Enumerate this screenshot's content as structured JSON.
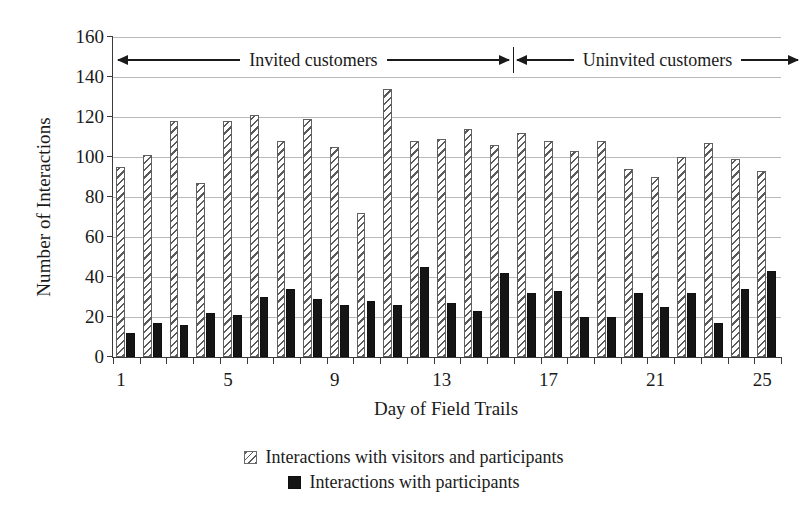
{
  "chart_data": {
    "type": "bar",
    "title": "",
    "xlabel": "Day of Field Trails",
    "ylabel": "Number of Interactions",
    "ylim": [
      0,
      160
    ],
    "ytick_step": 20,
    "yticks": [
      0,
      20,
      40,
      60,
      80,
      100,
      120,
      140,
      160
    ],
    "grid": true,
    "legend_position": "bottom",
    "categories": [
      1,
      2,
      3,
      4,
      5,
      6,
      7,
      8,
      9,
      10,
      11,
      12,
      13,
      14,
      15,
      16,
      17,
      18,
      19,
      20,
      21,
      22,
      23,
      24,
      25
    ],
    "xtick_labels": [
      "1",
      "5",
      "9",
      "13",
      "17",
      "21",
      "25"
    ],
    "xtick_label_days": [
      1,
      5,
      9,
      13,
      17,
      21,
      25
    ],
    "series": [
      {
        "name": "Interactions with visitors and participants",
        "style": "hatched",
        "values": [
          95,
          101,
          118,
          87,
          118,
          121,
          108,
          119,
          105,
          72,
          134,
          108,
          109,
          114,
          106,
          112,
          108,
          103,
          108,
          94,
          90,
          100,
          107,
          99,
          93
        ]
      },
      {
        "name": "Interactions with participants",
        "style": "solid-black",
        "values": [
          12,
          17,
          16,
          22,
          21,
          30,
          34,
          29,
          26,
          28,
          26,
          45,
          27,
          23,
          42,
          32,
          33,
          20,
          20,
          32,
          25,
          32,
          17,
          34,
          43
        ]
      }
    ],
    "annotations": [
      {
        "id": "invited",
        "text": "Invited customers",
        "span_days": [
          1,
          15
        ],
        "arrow": "double"
      },
      {
        "id": "uninvited",
        "text": "Uninvited customers",
        "span_days": [
          16,
          25
        ],
        "arrow": "double"
      }
    ]
  },
  "axes": {
    "ylabel": "Number of Interactions",
    "xlabel": "Day of Field Trails"
  },
  "legend": {
    "items": [
      {
        "label": "Interactions with visitors and participants",
        "swatch": "hatched-square"
      },
      {
        "label": "Interactions with participants",
        "swatch": "black-square"
      }
    ]
  },
  "annotations": {
    "invited": "Invited customers",
    "uninvited": "Uninvited customers"
  },
  "colors": {
    "hatch_line": "#5a5a5a",
    "solid_bar": "#151515",
    "gridline": "#b9b9b9",
    "axis": "#3a3a3a",
    "text": "#1a1a1a",
    "background": "#ffffff"
  }
}
